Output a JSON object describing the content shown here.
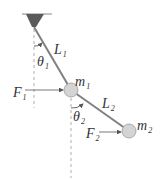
{
  "diagram": {
    "colors": {
      "rod": "#808080",
      "mass_fill": "#d4d4d4",
      "mass_stroke": "#9a9a9a",
      "pivot": "#5a5a5a",
      "dashed": "#9a9a9a",
      "arrow": "#555555",
      "text": "#333333"
    },
    "labels": {
      "L1": {
        "main": "L",
        "sub": "1"
      },
      "L2": {
        "main": "L",
        "sub": "2"
      },
      "theta1": {
        "main": "θ",
        "sub": "1"
      },
      "theta2": {
        "main": "θ",
        "sub": "2"
      },
      "m1": {
        "main": "m",
        "sub": "1"
      },
      "m2": {
        "main": "m",
        "sub": "2"
      },
      "F1": {
        "main": "F",
        "sub": "1"
      },
      "F2": {
        "main": "F",
        "sub": "2"
      }
    },
    "geometry": {
      "pivot": [
        34,
        27
      ],
      "m1": [
        71,
        90
      ],
      "m2": [
        129,
        131
      ],
      "mass_radius": 7
    }
  }
}
